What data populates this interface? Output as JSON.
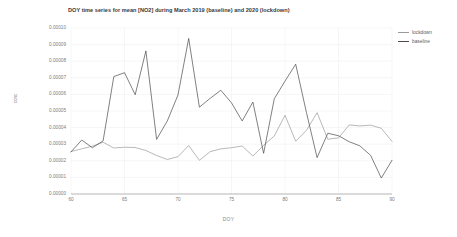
{
  "chart_data": {
    "type": "line",
    "title": "DOY time series for mean [NO2] during March 2019 (baseline) and 2020 (lockdown)",
    "xlabel": "DOY",
    "ylabel": "conc",
    "xlim": [
      60,
      90
    ],
    "ylim": [
      0.0,
      0.0001
    ],
    "grid": true,
    "legend_position": "top-right",
    "xticks": [
      60,
      65,
      70,
      75,
      80,
      85,
      90
    ],
    "xtick_labels": [
      "60",
      "65",
      "70",
      "75",
      "80",
      "85",
      "90"
    ],
    "yticks": [
      0.0,
      1e-05,
      2e-05,
      3e-05,
      4e-05,
      5e-05,
      6e-05,
      7e-05,
      8e-05,
      9e-05,
      0.0001
    ],
    "ytick_labels": [
      "0.00000",
      "0.00001",
      "0.00002",
      "0.00003",
      "0.00004",
      "0.00005",
      "0.00006",
      "0.00007",
      "0.00008",
      "0.00009",
      "0.00010"
    ],
    "x": [
      60,
      61,
      62,
      63,
      64,
      65,
      66,
      67,
      68,
      69,
      70,
      71,
      72,
      73,
      74,
      75,
      76,
      77,
      78,
      79,
      80,
      81,
      82,
      83,
      84,
      85,
      86,
      87,
      88,
      89,
      90
    ],
    "series": [
      {
        "name": "lockdown",
        "color": "#9a9a9a",
        "values": [
          2.56e-05,
          2.72e-05,
          2.88e-05,
          3.12e-05,
          2.77e-05,
          2.82e-05,
          2.8e-05,
          2.62e-05,
          2.32e-05,
          2.08e-05,
          2.25e-05,
          2.92e-05,
          2.03e-05,
          2.55e-05,
          2.72e-05,
          2.79e-05,
          2.89e-05,
          2.29e-05,
          2.93e-05,
          3.5e-05,
          4.74e-05,
          3.18e-05,
          3.83e-05,
          4.9e-05,
          3.3e-05,
          3.38e-05,
          4.16e-05,
          4.1e-05,
          4.15e-05,
          3.96e-05,
          3.17e-05
        ]
      },
      {
        "name": "baseline",
        "color": "#4a4a4a",
        "values": [
          2.53e-05,
          3.25e-05,
          2.79e-05,
          3.2e-05,
          7.07e-05,
          7.31e-05,
          5.98e-05,
          8.62e-05,
          3.29e-05,
          4.4e-05,
          5.97e-05,
          9.37e-05,
          5.23e-05,
          5.76e-05,
          6.25e-05,
          5.49e-05,
          4.4e-05,
          5.54e-05,
          2.45e-05,
          5.74e-05,
          6.8e-05,
          7.82e-05,
          4.92e-05,
          2.19e-05,
          3.66e-05,
          3.51e-05,
          3.15e-05,
          2.9e-05,
          2.33e-05,
          9.6e-06,
          2.03e-05
        ]
      }
    ]
  },
  "legend": {
    "items": [
      {
        "label": "lockdown"
      },
      {
        "label": "baseline"
      }
    ]
  }
}
